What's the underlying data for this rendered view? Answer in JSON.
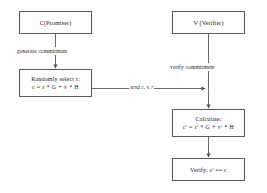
{
  "diagram": {
    "type": "flowchart",
    "background_color": "#ffffff",
    "stroke_color": "#5a5a5a",
    "text_color": "#1d1d1d",
    "columns": {
      "left": "C (Prover)",
      "right": "V (Verifier)"
    },
    "nodes": {
      "prover_header": {
        "label": "C(Promiser)"
      },
      "verifier_header": {
        "label": "V (Verifier)"
      },
      "randomly_select": {
        "line1": "Randomly select r:",
        "line2": "c = r * G + v * H"
      },
      "calculate": {
        "line1": "Calculate:",
        "line2": "c' = r' * G + v' * H"
      },
      "verify": {
        "line1": "Verify: c' == c"
      }
    },
    "edges": {
      "generate_commitment": {
        "label": "generate commitment"
      },
      "send_values": {
        "label": "send c, v, r"
      },
      "verify_commitment": {
        "label": "verify commitment"
      }
    }
  }
}
